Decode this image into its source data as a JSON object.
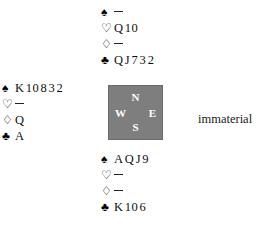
{
  "diagram": {
    "type": "bridge-deal-diagram",
    "compass": {
      "north_label": "N",
      "south_label": "S",
      "west_label": "W",
      "east_label": "E",
      "fill_color": "#7e7e7e",
      "text_color": "#ffffff"
    },
    "suit_symbols": {
      "spade": "♠",
      "heart": "♡",
      "diamond": "♢",
      "club": "♣"
    },
    "void_marker": "—",
    "hands": {
      "north": {
        "position_label": "North",
        "spades": "",
        "spades_void": true,
        "hearts": "Q 10",
        "hearts_void": false,
        "diamonds": "",
        "diamonds_void": true,
        "clubs": "Q J 7 3 2",
        "clubs_void": false
      },
      "west": {
        "position_label": "West",
        "spades": "K 10 8 3 2",
        "spades_void": false,
        "hearts": "",
        "hearts_void": true,
        "diamonds": "Q",
        "diamonds_void": false,
        "clubs": "A",
        "clubs_void": false
      },
      "south": {
        "position_label": "South",
        "spades": "A Q J 9",
        "spades_void": false,
        "hearts": "",
        "hearts_void": true,
        "diamonds": "",
        "diamonds_void": true,
        "clubs": "K 10 6",
        "clubs_void": false
      },
      "east": {
        "position_label": "East",
        "note": "immaterial"
      }
    }
  }
}
